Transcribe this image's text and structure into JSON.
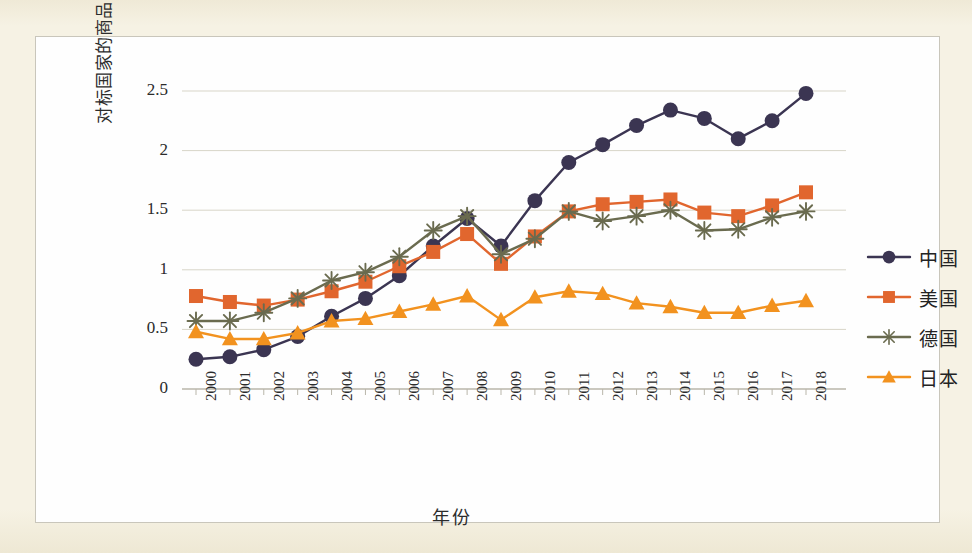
{
  "chart_data": {
    "type": "line",
    "title": "",
    "xlabel": "年份",
    "ylabel": "对标国家的商品贸易出口额/万亿美元",
    "x": [
      "2000",
      "2001",
      "2002",
      "2003",
      "2004",
      "2005",
      "2006",
      "2007",
      "2008",
      "2009",
      "2010",
      "2011",
      "2012",
      "2013",
      "2014",
      "2015",
      "2016",
      "2017",
      "2018"
    ],
    "categories": [
      "2000",
      "2001",
      "2002",
      "2003",
      "2004",
      "2005",
      "2006",
      "2007",
      "2008",
      "2009",
      "2010",
      "2011",
      "2012",
      "2013",
      "2014",
      "2015",
      "2016",
      "2017",
      "2018"
    ],
    "ylim": [
      0,
      2.5
    ],
    "yticks": [
      "0",
      "0.5",
      "1",
      "1.5",
      "2",
      "2.5"
    ],
    "ytick_values": [
      0,
      0.5,
      1,
      1.5,
      2,
      2.5
    ],
    "grid": true,
    "legend_position": "right",
    "series": [
      {
        "name": "中国",
        "color": "#3b3552",
        "marker": "circle",
        "values": [
          0.25,
          0.27,
          0.33,
          0.44,
          0.61,
          0.76,
          0.95,
          1.2,
          1.43,
          1.2,
          1.58,
          1.9,
          2.05,
          2.21,
          2.34,
          2.27,
          2.1,
          2.25,
          2.48
        ]
      },
      {
        "name": "美国",
        "color": "#e1662e",
        "marker": "square",
        "values": [
          0.78,
          0.73,
          0.7,
          0.75,
          0.82,
          0.9,
          1.03,
          1.15,
          1.3,
          1.05,
          1.28,
          1.49,
          1.55,
          1.57,
          1.59,
          1.48,
          1.45,
          1.54,
          1.65
        ]
      },
      {
        "name": "德国",
        "color": "#6a6b4f",
        "marker": "asterisk",
        "values": [
          0.57,
          0.57,
          0.64,
          0.76,
          0.91,
          0.98,
          1.11,
          1.33,
          1.45,
          1.13,
          1.26,
          1.49,
          1.41,
          1.45,
          1.5,
          1.33,
          1.34,
          1.44,
          1.49
        ]
      },
      {
        "name": "日本",
        "color": "#f2921f",
        "marker": "triangle",
        "values": [
          0.48,
          0.42,
          0.42,
          0.47,
          0.57,
          0.59,
          0.65,
          0.71,
          0.78,
          0.58,
          0.77,
          0.82,
          0.8,
          0.72,
          0.69,
          0.64,
          0.64,
          0.7,
          0.74
        ]
      }
    ]
  },
  "axis": {
    "y_title": "对标国家的商品贸易出口额/万亿美元",
    "x_title": "年份"
  },
  "legend": {
    "items": [
      {
        "label": "中国",
        "color": "#3b3552",
        "marker": "circle-marker"
      },
      {
        "label": "美国",
        "color": "#e1662e",
        "marker": "square-marker"
      },
      {
        "label": "德国",
        "color": "#6a6b4f",
        "marker": "asterisk-marker"
      },
      {
        "label": "日本",
        "color": "#f2921f",
        "marker": "triangle-marker"
      }
    ]
  },
  "colors": {
    "page_background": "#f5f1e2",
    "panel_background": "#fefefe",
    "grid": "#d8d5c8",
    "axis": "#b9b6aa",
    "text": "#2b2b2b"
  }
}
